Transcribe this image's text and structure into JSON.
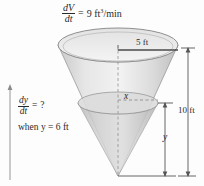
{
  "figure": {
    "title_equation": {
      "numerator": "dV",
      "denominator": "dt",
      "equals": "=",
      "value": "9 ft",
      "exponent": "3",
      "unit": "/min",
      "full": "dV/dt = 9 ft^3/min"
    },
    "question_equation": {
      "numerator": "dy",
      "denominator": "dt",
      "equals": "=",
      "value": "?",
      "full": "dy/dt = ?"
    },
    "condition_text": "when y = 6 ft",
    "radius_label": "5 ft",
    "height_label": "10 ft",
    "water_radius_label": "x",
    "water_height_label": "y",
    "colors": {
      "cone_fill": "#d9d9d9",
      "cone_stroke": "#8a8a8a",
      "water_fill": "#cfcfcf",
      "text": "#2a2a2a",
      "dimension_line": "#555555",
      "dashed_line": "#9a9a9a",
      "radius_line": "#4a4a4a"
    }
  }
}
